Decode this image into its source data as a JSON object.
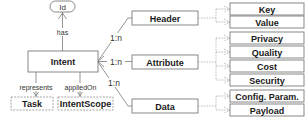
{
  "diagram": {
    "type": "entity-relationship",
    "root": {
      "label": "Intent",
      "identifier": {
        "label": "Id",
        "relation": "has"
      },
      "relations": [
        {
          "label": "represents",
          "target": "Task"
        },
        {
          "label": "appliedOn",
          "target": "IntentScope"
        }
      ]
    },
    "components": [
      {
        "label": "Header",
        "cardinality": "1:n",
        "children": [
          "Key",
          "Value"
        ]
      },
      {
        "label": "Attribute",
        "cardinality": "1:n",
        "children": [
          "Privacy",
          "Quality",
          "Cost",
          "Security"
        ]
      },
      {
        "label": "Data",
        "cardinality": "1:n",
        "children": [
          "Config. Param.",
          "Payload"
        ]
      }
    ]
  },
  "labels": {
    "id": "Id",
    "has": "has",
    "intent": "Intent",
    "represents": "represents",
    "applied_on": "appliedOn",
    "task": "Task",
    "intent_scope": "IntentScope",
    "header": "Header",
    "attribute": "Attribute",
    "data": "Data",
    "card_header": "1:n",
    "card_attribute": "1:n",
    "card_data": "1:n",
    "key": "Key",
    "value": "Value",
    "privacy": "Privacy",
    "quality": "Quality",
    "cost": "Cost",
    "security": "Security",
    "config_param": "Config. Param.",
    "payload": "Payload"
  },
  "colors": {
    "border": "#7a7a7a",
    "dashed_border": "#9a9a9a",
    "text": "#1a1a1a",
    "background": "#ffffff"
  }
}
